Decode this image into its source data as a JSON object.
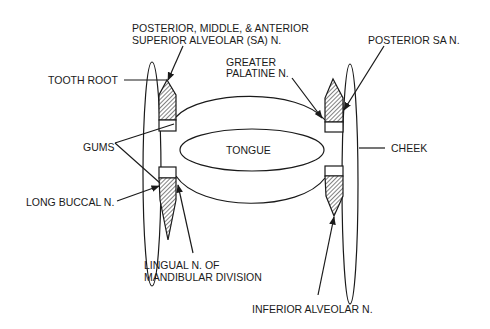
{
  "diagram": {
    "type": "anatomical-cross-section",
    "labels": {
      "sa_nerves_line1": "POSTERIOR, MIDDLE, & ANTERIOR",
      "sa_nerves_line2": "SUPERIOR ALVEOLAR (SA) N.",
      "posterior_sa": "POSTERIOR SA N.",
      "greater_palatine_line1": "GREATER",
      "greater_palatine_line2": "PALATINE N.",
      "tooth_root": "TOOTH ROOT",
      "gums": "GUMS",
      "tongue": "TONGUE",
      "cheek": "CHEEK",
      "long_buccal": "LONG BUCCAL N.",
      "lingual_line1": "LINGUAL N. OF",
      "lingual_line2": "MANDIBULAR DIVISION",
      "inferior_alveolar": "INFERIOR ALVEOLAR N."
    },
    "colors": {
      "ink": "#1a1a1a",
      "background": "#ffffff"
    }
  }
}
